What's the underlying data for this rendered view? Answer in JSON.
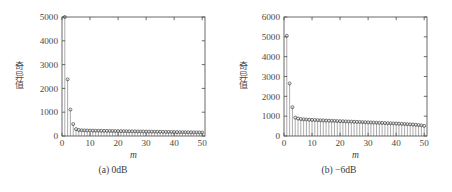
{
  "figure": {
    "panel_count": 2,
    "background_color": "#ffffff",
    "line_color": "#5a5a5a",
    "marker_color": "#4a4a4a",
    "stem_color": "#888888"
  },
  "panels": [
    {
      "id": "panel-a",
      "caption": "(a) 0dB",
      "ylabel": "奇异值",
      "xlabel": "m"
    },
    {
      "id": "panel-b",
      "caption": "(b) −6dB",
      "ylabel": "奇异值",
      "xlabel": "m"
    }
  ],
  "chart_data": [
    {
      "type": "line",
      "title": "(a) 0dB",
      "xlabel": "m",
      "ylabel": "奇异值",
      "xlim": [
        0,
        51
      ],
      "ylim": [
        0,
        5000
      ],
      "xticks": [
        0,
        10,
        20,
        30,
        40,
        50
      ],
      "yticks": [
        0,
        1000,
        2000,
        3000,
        4000,
        5000
      ],
      "xticklabels": [
        "0",
        "10",
        "20",
        "30",
        "40",
        "50"
      ],
      "yticklabels": [
        "0",
        "1000",
        "2000",
        "3000",
        "4000",
        "5000"
      ],
      "grid": false,
      "legend": "none",
      "marker": "circle",
      "stems": true,
      "x": [
        1,
        2,
        3,
        4,
        5,
        6,
        7,
        8,
        9,
        10,
        11,
        12,
        13,
        14,
        15,
        16,
        17,
        18,
        19,
        20,
        21,
        22,
        23,
        24,
        25,
        26,
        27,
        28,
        29,
        30,
        31,
        32,
        33,
        34,
        35,
        36,
        37,
        38,
        39,
        40,
        41,
        42,
        43,
        44,
        45,
        46,
        47,
        48,
        49,
        50
      ],
      "values": [
        5000,
        2380,
        1110,
        500,
        290,
        250,
        240,
        235,
        230,
        228,
        225,
        222,
        220,
        218,
        216,
        214,
        212,
        210,
        208,
        206,
        204,
        202,
        200,
        198,
        196,
        194,
        192,
        190,
        188,
        186,
        184,
        182,
        180,
        178,
        176,
        174,
        172,
        170,
        168,
        166,
        164,
        162,
        160,
        158,
        156,
        154,
        152,
        150,
        148,
        146
      ]
    },
    {
      "type": "line",
      "title": "(b) −6dB",
      "xlabel": "m",
      "ylabel": "奇异值",
      "xlim": [
        0,
        51
      ],
      "ylim": [
        0,
        6000
      ],
      "xticks": [
        0,
        10,
        20,
        30,
        40,
        50
      ],
      "yticks": [
        0,
        1000,
        2000,
        3000,
        4000,
        5000,
        6000
      ],
      "xticklabels": [
        "0",
        "10",
        "20",
        "30",
        "40",
        "50"
      ],
      "yticklabels": [
        "0",
        "1000",
        "2000",
        "3000",
        "4000",
        "5000",
        "6000"
      ],
      "grid": false,
      "legend": "none",
      "marker": "circle",
      "stems": true,
      "x": [
        1,
        2,
        3,
        4,
        5,
        6,
        7,
        8,
        9,
        10,
        11,
        12,
        13,
        14,
        15,
        16,
        17,
        18,
        19,
        20,
        21,
        22,
        23,
        24,
        25,
        26,
        27,
        28,
        29,
        30,
        31,
        32,
        33,
        34,
        35,
        36,
        37,
        38,
        39,
        40,
        41,
        42,
        43,
        44,
        45,
        46,
        47,
        48,
        49,
        50
      ],
      "values": [
        5050,
        2650,
        1450,
        930,
        880,
        855,
        840,
        830,
        820,
        812,
        805,
        798,
        790,
        784,
        778,
        772,
        766,
        760,
        754,
        748,
        742,
        736,
        730,
        724,
        718,
        712,
        706,
        700,
        694,
        688,
        682,
        676,
        670,
        664,
        658,
        652,
        646,
        640,
        634,
        628,
        620,
        612,
        604,
        596,
        588,
        578,
        566,
        552,
        535,
        510
      ]
    }
  ]
}
